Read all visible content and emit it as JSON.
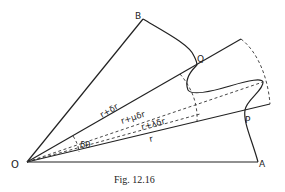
{
  "figure": {
    "caption": "Fig. 12.16",
    "points": {
      "O": "O",
      "A": "A",
      "B": "B",
      "P": "P",
      "Q": "Q"
    },
    "labels": {
      "upper_ray": "r+δr",
      "mid_ray_mu": "r+μδr",
      "mid_ray_lambda": "r+λδr",
      "lower_ray": "r",
      "angle": "δθ"
    },
    "colors": {
      "stroke": "#222222",
      "background": "#ffffff"
    }
  }
}
